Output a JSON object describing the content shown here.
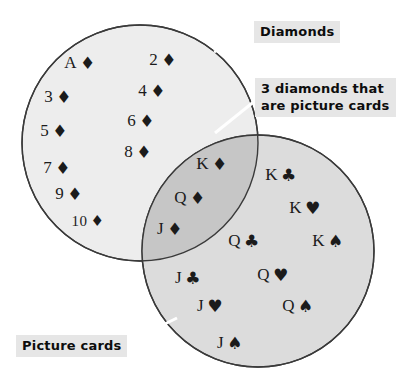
{
  "figure": {
    "type": "venn-diagram",
    "background_color": "#ffffff"
  },
  "colors": {
    "left_circle_fill": "#ededed",
    "right_circle_fill": "#dcdcdc",
    "intersection_fill": "#c6c6c6",
    "circle_stroke": "#3a3a3a",
    "label_background": "#e6e6e6",
    "label_text": "#0d0d0d",
    "card_text": "#1b1b1b",
    "leader_line": "#ffffff"
  },
  "labels": {
    "diamonds": {
      "text": "Diamonds",
      "x": 254,
      "y": 21
    },
    "intersection_note": {
      "line1": "3 diamonds that",
      "line2": "are picture cards",
      "x": 255,
      "y": 78
    },
    "picture_cards": {
      "text": "Picture cards",
      "x": 16,
      "y": 335
    }
  },
  "circles": {
    "left": {
      "name": "Diamonds",
      "cx": 140,
      "cy": 143,
      "r": 118
    },
    "right": {
      "name": "Picture cards",
      "cx": 258,
      "cy": 251,
      "r": 116
    }
  },
  "sets": {
    "diamonds_only": {
      "name": "Diamonds only",
      "count": 10,
      "cards": [
        {
          "rank": "A",
          "suit": "♦",
          "suit_name": "diamond",
          "x": 80,
          "y": 62
        },
        {
          "rank": "2",
          "suit": "♦",
          "suit_name": "diamond",
          "x": 163,
          "y": 59
        },
        {
          "rank": "3",
          "suit": "♦",
          "suit_name": "diamond",
          "x": 58,
          "y": 96
        },
        {
          "rank": "4",
          "suit": "♦",
          "suit_name": "diamond",
          "x": 152,
          "y": 90
        },
        {
          "rank": "5",
          "suit": "♦",
          "suit_name": "diamond",
          "x": 54,
          "y": 130
        },
        {
          "rank": "6",
          "suit": "♦",
          "suit_name": "diamond",
          "x": 141,
          "y": 120
        },
        {
          "rank": "7",
          "suit": "♦",
          "suit_name": "diamond",
          "x": 57,
          "y": 167
        },
        {
          "rank": "8",
          "suit": "♦",
          "suit_name": "diamond",
          "x": 138,
          "y": 151
        },
        {
          "rank": "9",
          "suit": "♦",
          "suit_name": "diamond",
          "x": 69,
          "y": 193
        },
        {
          "rank": "10",
          "suit": "♦",
          "suit_name": "diamond",
          "x": 88,
          "y": 220
        }
      ]
    },
    "intersection": {
      "name": "Diamonds that are picture cards",
      "count": 3,
      "cards": [
        {
          "rank": "K",
          "suit": "♦",
          "suit_name": "diamond",
          "x": 212,
          "y": 163
        },
        {
          "rank": "Q",
          "suit": "♦",
          "suit_name": "diamond",
          "x": 190,
          "y": 197
        },
        {
          "rank": "J",
          "suit": "♦",
          "suit_name": "diamond",
          "x": 170,
          "y": 228
        }
      ]
    },
    "picture_cards_only": {
      "name": "Picture cards that are not diamonds",
      "count": 9,
      "cards": [
        {
          "rank": "K",
          "suit": "♣",
          "suit_name": "club",
          "x": 281,
          "y": 174
        },
        {
          "rank": "K",
          "suit": "♥",
          "suit_name": "heart",
          "x": 305,
          "y": 207
        },
        {
          "rank": "Q",
          "suit": "♣",
          "suit_name": "club",
          "x": 244,
          "y": 240
        },
        {
          "rank": "K",
          "suit": "♠",
          "suit_name": "spade",
          "x": 328,
          "y": 240
        },
        {
          "rank": "J",
          "suit": "♣",
          "suit_name": "club",
          "x": 188,
          "y": 277
        },
        {
          "rank": "Q",
          "suit": "♥",
          "suit_name": "heart",
          "x": 273,
          "y": 274
        },
        {
          "rank": "J",
          "suit": "♥",
          "suit_name": "heart",
          "x": 210,
          "y": 305
        },
        {
          "rank": "Q",
          "suit": "♠",
          "suit_name": "spade",
          "x": 298,
          "y": 305
        },
        {
          "rank": "J",
          "suit": "♠",
          "suit_name": "spade",
          "x": 230,
          "y": 342
        }
      ]
    }
  }
}
